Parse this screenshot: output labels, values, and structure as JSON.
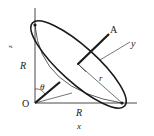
{
  "diagram": {
    "labels": {
      "origin": "O",
      "point_a": "A",
      "axis_x": "x",
      "axis_y": "y",
      "axis_z": "z",
      "radius_left": "R",
      "radius_bottom": "R",
      "disk_radius": "r",
      "angle": "θ"
    },
    "colors": {
      "stroke": "#1a1a1a",
      "background": "#ffffff"
    }
  }
}
